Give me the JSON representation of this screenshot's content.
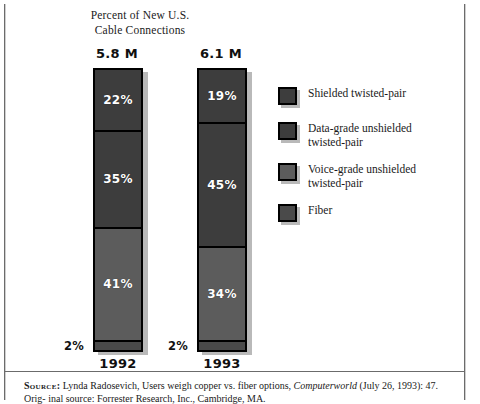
{
  "chart_data": {
    "type": "bar",
    "subtype": "stacked-100-percent",
    "title": "Percent of New U.S. Cable Connections",
    "title_lines": [
      "Percent of New U.S.",
      "Cable Connections"
    ],
    "xlabel": "",
    "ylabel": "",
    "ylim": [
      0,
      100
    ],
    "grid": false,
    "legend_position": "right",
    "categories": [
      "1992",
      "1993"
    ],
    "category_totals": [
      "5.8 M",
      "6.1 M"
    ],
    "series": [
      {
        "name": "Shielded twisted-pair",
        "name_lines": [
          "Shielded twisted-pair"
        ],
        "color": "#3d3d3d",
        "values": [
          22,
          19
        ],
        "labels": [
          "22%",
          "19%"
        ]
      },
      {
        "name": "Data-grade unshielded twisted-pair",
        "name_lines": [
          "Data-grade unshielded",
          "twisted-pair"
        ],
        "color": "#3d3d3d",
        "values": [
          35,
          45
        ],
        "labels": [
          "35%",
          "45%"
        ]
      },
      {
        "name": "Voice-grade unshielded twisted-pair",
        "name_lines": [
          "Voice-grade unshielded",
          "twisted-pair"
        ],
        "color": "#5c5c5c",
        "values": [
          41,
          34
        ],
        "labels": [
          "41%",
          "34%"
        ]
      },
      {
        "name": "Fiber",
        "name_lines": [
          "Fiber"
        ],
        "color": "#4a4a4a",
        "values": [
          2,
          2
        ],
        "labels": [
          "2%",
          "2%"
        ]
      }
    ]
  },
  "source": {
    "label": "Source:",
    "text_before_italic": " Lynda Radosevich, Users weigh copper vs. fiber options, ",
    "italic": "Computerworld",
    "text_after_italic": " (July 26, 1993): 47. Orig-",
    "line2": "inal source: Forrester Research, Inc., Cambridge, MA."
  }
}
